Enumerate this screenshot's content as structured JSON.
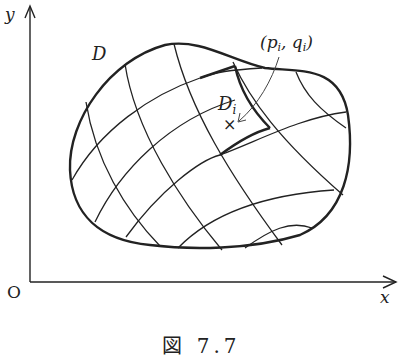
{
  "figure": {
    "caption": "図 7.7",
    "axes": {
      "x_label": "x",
      "y_label": "y",
      "origin_label": "O"
    },
    "region_label": "D",
    "subregion_label_main": "D",
    "subregion_label_sub": "i",
    "point_label": "(p",
    "point_label_sub1": "i",
    "point_label_mid": ", q",
    "point_label_sub2": "i",
    "point_label_close": ")",
    "point_marker": "×",
    "colors": {
      "stroke": "#222222",
      "background": "#ffffff"
    }
  }
}
